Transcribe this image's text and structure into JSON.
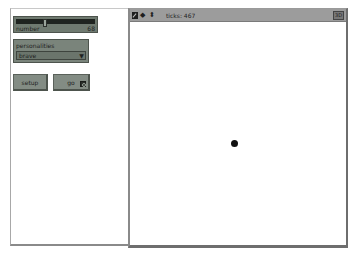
{
  "interface": {
    "slider": {
      "label": "number",
      "value": "68"
    },
    "chooser": {
      "label": "personalities",
      "value": "brave",
      "arrow": "▼"
    },
    "buttons": {
      "setup": "setup",
      "go": "go"
    }
  },
  "view": {
    "toolbar": {
      "icons": [
        "edit-icon",
        "left-right-arrow-icon",
        "up-down-arrow-icon"
      ],
      "lr_glyph": "◆",
      "ud_glyph": "⬍",
      "ticks_label": "ticks: 467",
      "three_d_label": "3D"
    },
    "turtle_count": 1
  }
}
